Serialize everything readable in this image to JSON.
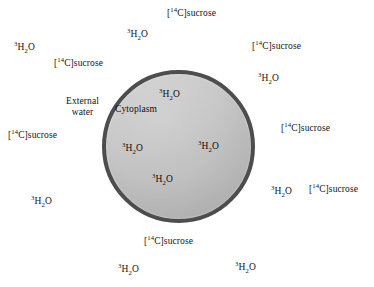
{
  "figure": {
    "type": "cell-diagram",
    "background_color": "#ffffff",
    "cell": {
      "membrane_color": "#4d4d4d",
      "cytoplasm_color": "#c2c2c2",
      "center_x": 178,
      "center_y": 146,
      "diameter": 153
    }
  },
  "tracers": {
    "water": {
      "isotope": "3",
      "formula_main": "H",
      "subscript": "2",
      "formula_tail": "O",
      "plain": "3H2O"
    },
    "sucrose": {
      "prefix": "[",
      "isotope": "14",
      "element": "C",
      "suffix": "]sucrose",
      "plain": "[14C]sucrose"
    }
  },
  "regions": [
    {
      "id": "external-water",
      "label_line1": "External",
      "label_line2": "water",
      "x": 66,
      "y": 96
    },
    {
      "id": "cytoplasm",
      "label": "Cytoplasm",
      "x": 115,
      "y": 104
    }
  ],
  "labels_outside": [
    {
      "id": "sucrose-top-center",
      "type": "sucrose",
      "x": 167,
      "y": 8
    },
    {
      "id": "water-top-left",
      "type": "water",
      "x": 127,
      "y": 29
    },
    {
      "id": "sucrose-top-right",
      "type": "sucrose",
      "x": 252,
      "y": 41
    },
    {
      "id": "water-upper-left",
      "type": "water",
      "x": 14,
      "y": 42
    },
    {
      "id": "sucrose-upper-left",
      "type": "sucrose",
      "x": 54,
      "y": 58
    },
    {
      "id": "water-right-upper",
      "type": "water",
      "x": 258,
      "y": 73
    },
    {
      "id": "sucrose-left-middle",
      "type": "sucrose",
      "x": 8,
      "y": 130
    },
    {
      "id": "sucrose-right-middle",
      "type": "sucrose",
      "x": 281,
      "y": 123
    },
    {
      "id": "water-right-lower",
      "type": "water",
      "x": 271,
      "y": 186
    },
    {
      "id": "sucrose-right-lower",
      "type": "sucrose",
      "x": 309,
      "y": 184
    },
    {
      "id": "water-lower-left",
      "type": "water",
      "x": 31,
      "y": 196
    },
    {
      "id": "sucrose-bottom",
      "type": "sucrose",
      "x": 144,
      "y": 236
    },
    {
      "id": "water-bottom-left",
      "type": "water",
      "x": 118,
      "y": 264
    },
    {
      "id": "water-bottom-right",
      "type": "water",
      "x": 235,
      "y": 262
    }
  ],
  "labels_inside": [
    {
      "id": "water-inner-top",
      "type": "water",
      "x": 159,
      "y": 89
    },
    {
      "id": "water-inner-left",
      "type": "water",
      "x": 122,
      "y": 143
    },
    {
      "id": "water-inner-right",
      "type": "water",
      "x": 198,
      "y": 141
    },
    {
      "id": "water-inner-bottom",
      "type": "water",
      "x": 152,
      "y": 174
    }
  ]
}
